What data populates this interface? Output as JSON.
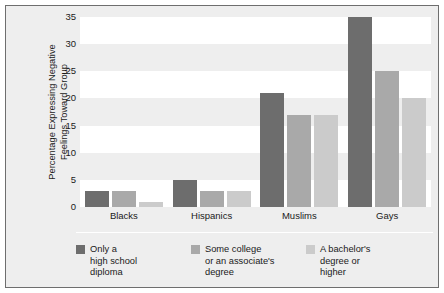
{
  "chart_data": {
    "type": "bar",
    "title": "",
    "xlabel": "",
    "ylabel": "Percentage Expressing Negative Feelings Toward Group",
    "ylabel_lines": [
      "Percentage Expressing Negative",
      "Feelings Toward Group"
    ],
    "categories": [
      "Blacks",
      "Hispanics",
      "Muslims",
      "Gays"
    ],
    "ylim": [
      0,
      35
    ],
    "yticks": [
      0,
      5,
      10,
      15,
      20,
      25,
      30,
      35
    ],
    "grid": false,
    "banded_background": true,
    "legend_position": "bottom",
    "series": [
      {
        "name": "Only a high school diploma",
        "name_lines": [
          "Only a",
          "high school",
          "diploma"
        ],
        "color": "#6d6d6d",
        "values": [
          3,
          5,
          21,
          35
        ]
      },
      {
        "name": "Some college or an associate's degree",
        "name_lines": [
          "Some college",
          "or an associate's",
          "degree"
        ],
        "color": "#a9a9a9",
        "values": [
          3,
          3,
          17,
          25
        ]
      },
      {
        "name": "A bachelor's degree or higher",
        "name_lines": [
          "A bachelor's",
          "degree or",
          "higher"
        ],
        "color": "#cbcbcb",
        "values": [
          1,
          3,
          17,
          20
        ]
      }
    ]
  },
  "colors": {
    "panel_background": "#eeeeee",
    "panel_border": "#6e6e6e",
    "band": "#ffffff",
    "text": "#1a1a1a"
  }
}
